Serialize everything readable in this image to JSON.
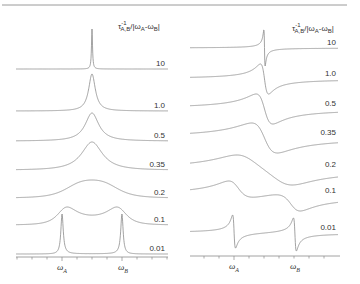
{
  "chart_data": [
    {
      "type": "line",
      "title": "Two-site exchange absorption lineshapes",
      "panel": "left",
      "legend_title": "τ_{A,B}^{-1}/|ω_A-ω_B|",
      "xlabel": "",
      "ylabel": "",
      "x_tick_labels": [
        "ω_A",
        "ω_B"
      ],
      "grid": false,
      "mode": "absorption",
      "series": [
        {
          "name": "10",
          "label": "10"
        },
        {
          "name": "1.0",
          "label": "1.0"
        },
        {
          "name": "0.5",
          "label": "0.5"
        },
        {
          "name": "0.35",
          "label": "0.35"
        },
        {
          "name": "0.2",
          "label": "0.2"
        },
        {
          "name": "0.1",
          "label": "0.1"
        },
        {
          "name": "0.01",
          "label": "0.01"
        }
      ]
    },
    {
      "type": "line",
      "title": "Two-site exchange dispersion lineshapes",
      "panel": "right",
      "legend_title": "τ_{A,B}^{-1}/|ω_A-ω_B|",
      "xlabel": "",
      "ylabel": "",
      "x_tick_labels": [
        "ω_A",
        "ω_B"
      ],
      "grid": false,
      "mode": "dispersion",
      "series": [
        {
          "name": "10",
          "label": "10"
        },
        {
          "name": "1.0",
          "label": "1.0"
        },
        {
          "name": "0.5",
          "label": "0.5"
        },
        {
          "name": "0.35",
          "label": "0.35"
        },
        {
          "name": "0.2",
          "label": "0.2"
        },
        {
          "name": "0.1",
          "label": "0.1"
        },
        {
          "name": "0.01",
          "label": "0.01"
        }
      ]
    }
  ],
  "legend": {
    "tau": "τ",
    "tau_sup": "-1",
    "tau_sub": "A,B",
    "slash_open": "/|ω",
    "omega_a_sub": "A",
    "minus": "-ω",
    "omega_b_sub": "B",
    "close": "|"
  },
  "axis": {
    "omega": "ω",
    "sub_a": "A",
    "sub_b": "B"
  },
  "style": {
    "line_color": "#8a8a8a",
    "text_color": "#333333",
    "frame_color": "#9a9a9a"
  }
}
